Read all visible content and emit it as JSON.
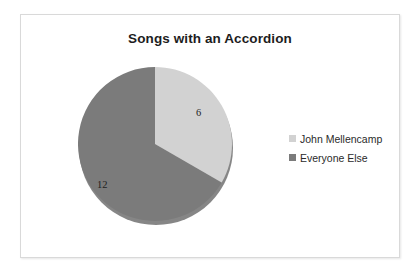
{
  "chart_data": {
    "type": "pie",
    "title": "Songs with an Accordion",
    "categories": [
      "John Mellencamp",
      "Everyone Else"
    ],
    "values": [
      6,
      12
    ],
    "data_labels": [
      "6",
      "12"
    ],
    "total": 18,
    "percentages": [
      33.3,
      66.7
    ],
    "start_angle_deg": 0,
    "direction": "clockwise",
    "colors": [
      "#d2d2d2",
      "#7b7b7b"
    ],
    "legend_position": "right",
    "grid": false,
    "xlabel": "",
    "ylabel": "",
    "slices": [
      {
        "name": "John Mellencamp",
        "value": 6,
        "label": "6",
        "color": "#d2d2d2",
        "start_deg": 0,
        "end_deg": 120
      },
      {
        "name": "Everyone Else",
        "value": 12,
        "label": "12",
        "color": "#7b7b7b",
        "start_deg": 120,
        "end_deg": 360
      }
    ]
  },
  "chart": {
    "title": "Songs with an Accordion",
    "frame_color": "#d9d9d9",
    "background": "#ffffff"
  },
  "legend": {
    "items": [
      {
        "label": "John Mellencamp",
        "color": "#d2d2d2"
      },
      {
        "label": "Everyone Else",
        "color": "#7b7b7b"
      }
    ]
  }
}
